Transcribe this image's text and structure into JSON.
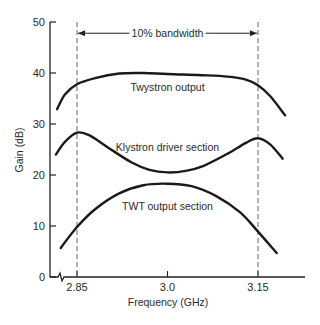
{
  "chart_data": {
    "type": "line",
    "title": "",
    "xlabel": "Frequency (GHz)",
    "ylabel": "Gain (dB)",
    "xlim": [
      2.8,
      3.24
    ],
    "ylim": [
      0,
      50
    ],
    "x_ticks": [
      {
        "value": 2.85,
        "label": "2.85"
      },
      {
        "value": 3.0,
        "label": "3.0"
      },
      {
        "value": 3.15,
        "label": "3.15"
      }
    ],
    "y_ticks": [
      {
        "value": 0,
        "label": "0"
      },
      {
        "value": 10,
        "label": "10"
      },
      {
        "value": 20,
        "label": "20"
      },
      {
        "value": 30,
        "label": "30"
      },
      {
        "value": 40,
        "label": "40"
      },
      {
        "value": 50,
        "label": "50"
      }
    ],
    "grid": false,
    "axis_break": true,
    "legend": null,
    "series": [
      {
        "name": "Twystron output",
        "label_pos": {
          "x": 3.0,
          "y": 36.5
        },
        "x": [
          2.817,
          2.83,
          2.85,
          2.88,
          2.92,
          2.96,
          3.0,
          3.05,
          3.1,
          3.13,
          3.15,
          3.17,
          3.195
        ],
        "values": [
          32.9,
          35.8,
          37.8,
          39.0,
          39.9,
          40.0,
          39.8,
          39.6,
          39.3,
          38.7,
          37.6,
          35.5,
          31.7
        ]
      },
      {
        "name": "Klystron driver section",
        "label_pos": {
          "x": 3.0,
          "y": 24.8
        },
        "x": [
          2.815,
          2.83,
          2.85,
          2.87,
          2.9,
          2.94,
          2.97,
          3.0,
          3.03,
          3.06,
          3.1,
          3.13,
          3.15,
          3.17,
          3.191
        ],
        "values": [
          24.0,
          26.5,
          28.3,
          27.8,
          25.5,
          22.5,
          21.0,
          20.5,
          20.8,
          21.8,
          24.2,
          26.3,
          27.2,
          26.0,
          23.2
        ]
      },
      {
        "name": "TWT output section",
        "label_pos": {
          "x": 3.0,
          "y": 13.2
        },
        "x": [
          2.823,
          2.85,
          2.88,
          2.92,
          2.96,
          3.0,
          3.04,
          3.08,
          3.12,
          3.15,
          3.181
        ],
        "values": [
          5.7,
          9.8,
          13.3,
          16.4,
          18.0,
          18.3,
          17.8,
          15.9,
          12.7,
          8.9,
          4.7
        ]
      }
    ],
    "annotations": [
      {
        "type": "vline",
        "x": 2.85,
        "style": "dashed"
      },
      {
        "type": "vline",
        "x": 3.15,
        "style": "dashed"
      },
      {
        "type": "double-arrow",
        "from": 2.85,
        "to": 3.15,
        "y": 47.8,
        "label": "10% bandwidth"
      }
    ]
  }
}
